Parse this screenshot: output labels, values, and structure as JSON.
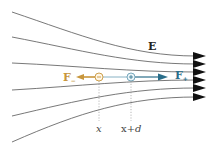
{
  "diagram": {
    "field_label": "E",
    "force_negative": {
      "label": "F",
      "subscript": "−",
      "color": "#c8963c"
    },
    "force_positive": {
      "label": "F",
      "subscript": "+",
      "color": "#2a6e8a"
    },
    "position_negative": "x",
    "position_positive_prefix": "x+",
    "position_positive_var": "d",
    "charges": [
      {
        "sign": "−",
        "cx": 99,
        "cy": 77,
        "color": "#c8963c"
      },
      {
        "sign": "+",
        "cx": 131,
        "cy": 77,
        "color": "#2a6e8a"
      }
    ],
    "field_lines": [
      {
        "start_y": 12,
        "end_y": 56
      },
      {
        "start_y": 37,
        "end_y": 64
      },
      {
        "start_y": 63,
        "end_y": 72
      },
      {
        "start_y": 90,
        "end_y": 80
      },
      {
        "start_y": 116,
        "end_y": 88
      },
      {
        "start_y": 142,
        "end_y": 97
      }
    ],
    "line_color": "#555555",
    "arrow_color": "#111111"
  }
}
